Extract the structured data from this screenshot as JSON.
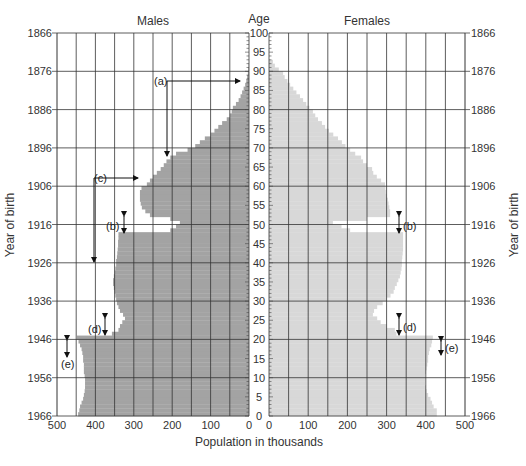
{
  "chart_data": {
    "type": "bar",
    "subtype": "population-pyramid",
    "title_left": "Males",
    "title_right": "Females",
    "center_axis_label": "Age",
    "xlabel": "Population in thousands",
    "ylabel_left": "Year of birth",
    "ylabel_right": "Year of birth",
    "age_ticks": [
      0,
      5,
      10,
      15,
      20,
      25,
      30,
      35,
      40,
      45,
      50,
      55,
      60,
      65,
      70,
      75,
      80,
      85,
      90,
      95,
      100
    ],
    "birth_year_ticks": [
      {
        "year": "1866",
        "age": 100
      },
      {
        "year": "1876",
        "age": 90
      },
      {
        "year": "1886",
        "age": 80
      },
      {
        "year": "1896",
        "age": 70
      },
      {
        "year": "1906",
        "age": 60
      },
      {
        "year": "1916",
        "age": 50
      },
      {
        "year": "1926",
        "age": 40
      },
      {
        "year": "1936",
        "age": 30
      },
      {
        "year": "1946",
        "age": 20
      },
      {
        "year": "1956",
        "age": 10
      },
      {
        "year": "1966",
        "age": 0
      }
    ],
    "x_ticks_males": [
      500,
      400,
      300,
      200,
      100,
      0
    ],
    "x_ticks_females": [
      0,
      100,
      200,
      300,
      400,
      500
    ],
    "xlim": [
      0,
      500
    ],
    "ylim": [
      0,
      100
    ],
    "grid": true,
    "colors": {
      "males": "#a3a3a3",
      "females": "#d8d8d8",
      "grid": "#333333"
    },
    "series": [
      {
        "name": "Males",
        "ages": [
          0,
          1,
          2,
          3,
          4,
          5,
          6,
          7,
          8,
          9,
          10,
          11,
          12,
          13,
          14,
          15,
          16,
          17,
          18,
          19,
          20,
          21,
          22,
          23,
          24,
          25,
          26,
          27,
          28,
          29,
          30,
          31,
          32,
          33,
          34,
          35,
          36,
          37,
          38,
          39,
          40,
          41,
          42,
          43,
          44,
          45,
          46,
          47,
          48,
          49,
          50,
          51,
          52,
          53,
          54,
          55,
          56,
          57,
          58,
          59,
          60,
          61,
          62,
          63,
          64,
          65,
          66,
          67,
          68,
          69,
          70,
          71,
          72,
          73,
          74,
          75,
          76,
          77,
          78,
          79,
          80,
          81,
          82,
          83,
          84,
          85,
          86,
          87,
          88,
          89,
          90,
          91,
          92
        ],
        "values": [
          445,
          442,
          440,
          436,
          432,
          430,
          428,
          427,
          427,
          427,
          428,
          430,
          430,
          430,
          432,
          432,
          434,
          436,
          440,
          444,
          448,
          357,
          340,
          336,
          330,
          323,
          328,
          336,
          340,
          344,
          346,
          348,
          350,
          352,
          354,
          354,
          352,
          350,
          348,
          346,
          346,
          344,
          343,
          342,
          341,
          341,
          340,
          340,
          205,
          190,
          180,
          205,
          258,
          270,
          279,
          282,
          284,
          284,
          284,
          280,
          266,
          258,
          250,
          240,
          230,
          222,
          215,
          205,
          190,
          160,
          140,
          128,
          115,
          100,
          90,
          80,
          70,
          58,
          50,
          45,
          42,
          34,
          27,
          22,
          18,
          14,
          10,
          7,
          5,
          3,
          2,
          1,
          0
        ]
      },
      {
        "name": "Females",
        "ages": [
          0,
          1,
          2,
          3,
          4,
          5,
          6,
          7,
          8,
          9,
          10,
          11,
          12,
          13,
          14,
          15,
          16,
          17,
          18,
          19,
          20,
          21,
          22,
          23,
          24,
          25,
          26,
          27,
          28,
          29,
          30,
          31,
          32,
          33,
          34,
          35,
          36,
          37,
          38,
          39,
          40,
          41,
          42,
          43,
          44,
          45,
          46,
          47,
          48,
          49,
          50,
          51,
          52,
          53,
          54,
          55,
          56,
          57,
          58,
          59,
          60,
          61,
          62,
          63,
          64,
          65,
          66,
          67,
          68,
          69,
          70,
          71,
          72,
          73,
          74,
          75,
          76,
          77,
          78,
          79,
          80,
          81,
          82,
          83,
          84,
          85,
          86,
          87,
          88,
          89,
          90,
          91,
          92
        ],
        "values": [
          428,
          428,
          420,
          416,
          412,
          406,
          402,
          400,
          398,
          398,
          398,
          400,
          402,
          404,
          406,
          406,
          408,
          410,
          414,
          416,
          418,
          325,
          321,
          300,
          285,
          276,
          265,
          268,
          276,
          290,
          301,
          310,
          318,
          321,
          326,
          330,
          334,
          336,
          338,
          339,
          339,
          340,
          341,
          342,
          342,
          342,
          342,
          342,
          207,
          185,
          163,
          250,
          309,
          309,
          307,
          305,
          303,
          300,
          298,
          297,
          296,
          286,
          275,
          266,
          263,
          250,
          240,
          235,
          220,
          207,
          195,
          186,
          176,
          164,
          153,
          143,
          135,
          125,
          118,
          112,
          103,
          95,
          87,
          79,
          70,
          62,
          54,
          47,
          40,
          36,
          25,
          15,
          10
        ]
      }
    ],
    "annotations": [
      {
        "label": "(a)",
        "description": "arrows from age 87 marker to age 67"
      },
      {
        "label": "(b)",
        "description": "double-headed arrow at ages 47-51 on both sides"
      },
      {
        "label": "(c)",
        "description": "arrow from age 61 to age 40"
      },
      {
        "label": "(d)",
        "description": "double-headed arrow at ages 21-25 on both sides"
      },
      {
        "label": "(e)",
        "description": "double-headed arrow at ages 16-20 on both sides"
      }
    ]
  }
}
